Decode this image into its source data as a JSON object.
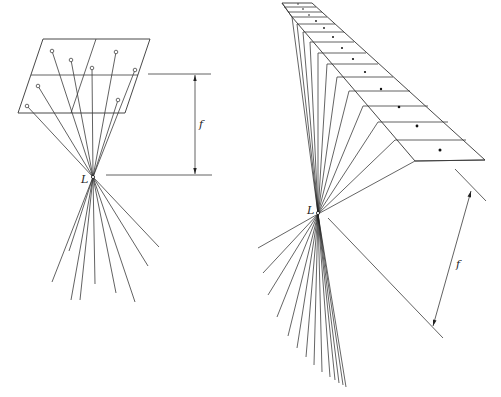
{
  "figure": {
    "left_panel": {
      "description": "Perspective center L with image plane (2x2 grid of object points) at focal distance f",
      "label_center": "L",
      "label_focal": "f",
      "grid": {
        "rows": 2,
        "cols": 2
      },
      "points_count": 8
    },
    "right_panel": {
      "description": "Tilted strip of 12 cells projected through perspective center L with focal distance f",
      "label_center": "L",
      "label_focal": "f",
      "strip_cells": 12
    }
  }
}
